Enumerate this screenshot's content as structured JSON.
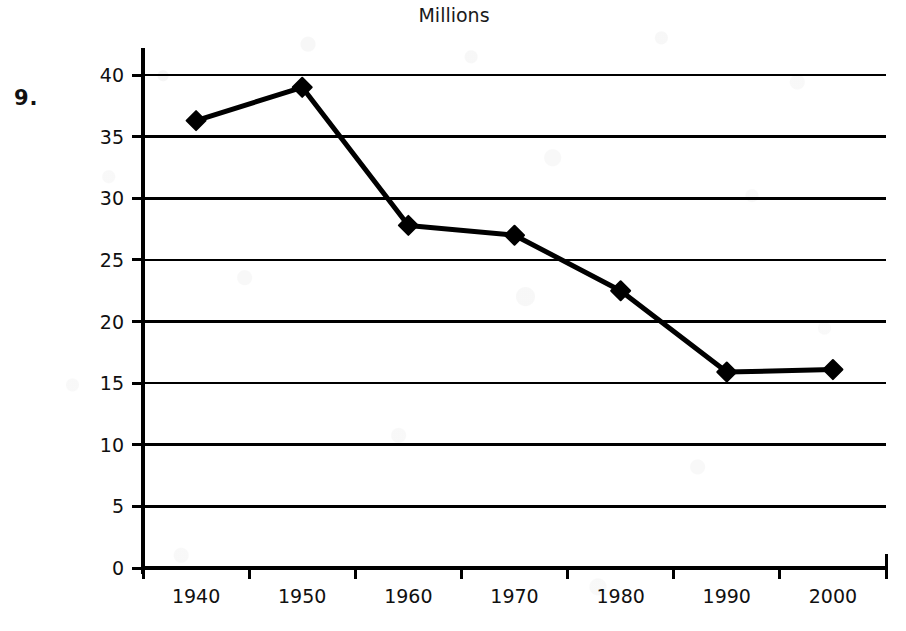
{
  "worksheet": {
    "problem_number": "9."
  },
  "chart_data": {
    "type": "line",
    "title": "Millions",
    "xlabel": "",
    "ylabel": "",
    "categories": [
      "1940",
      "1950",
      "1960",
      "1970",
      "1980",
      "1990",
      "2000"
    ],
    "values": [
      36.3,
      39.0,
      27.8,
      27.0,
      22.5,
      15.9,
      16.1
    ],
    "series": [
      {
        "name": "Millions",
        "values": [
          36.3,
          39.0,
          27.8,
          27.0,
          22.5,
          15.9,
          16.1
        ]
      }
    ],
    "ylim": [
      0,
      40
    ],
    "y_ticks": [
      0,
      5,
      10,
      15,
      20,
      25,
      30,
      35,
      40
    ],
    "y_tick_labels": [
      "0",
      "5",
      "10",
      "15",
      "20",
      "25",
      "30",
      "35",
      "40"
    ],
    "grid": true,
    "grid_axis": "y",
    "legend": "none",
    "marker": "diamond",
    "line_color": "#000000",
    "marker_color": "#000000",
    "grid_color": "#000000",
    "axis_color": "#000000",
    "background_color": "#ffffff"
  }
}
